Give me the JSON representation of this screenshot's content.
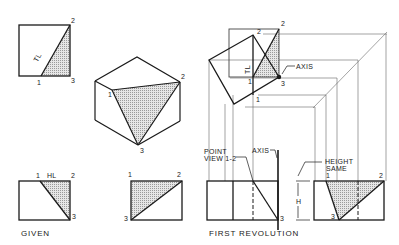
{
  "colors": {
    "line": "#1a1a1a",
    "thin": "#555555",
    "shade": "#d9d9d9"
  },
  "views": {
    "given": {
      "caption": "GIVEN",
      "top_view": {
        "labels": {
          "v1": "1",
          "v2": "2",
          "v3": "3",
          "tl": "TL"
        }
      },
      "front_view": {
        "labels": {
          "v1": "1",
          "v2": "2",
          "v3": "3",
          "hl": "HL"
        }
      }
    },
    "pictorial": {
      "labels": {
        "v1": "1",
        "v2": "2",
        "v3": "3"
      }
    },
    "auxiliary_front": {
      "labels": {
        "v1": "1",
        "v2": "2",
        "v3": "3"
      }
    },
    "first_revolution": {
      "caption": "FIRST REVOLUTION",
      "top_labels": {
        "v1": "1",
        "v2": "2",
        "v3": "3",
        "tl": "TL",
        "axis": "AXIS",
        "v1b": "1"
      },
      "front_labels": {
        "point_view_1": "POINT",
        "point_view_2": "VIEW 1-2",
        "axis": "AXIS",
        "v3": "3",
        "h": "H"
      },
      "side_labels": {
        "height_1": "HEIGHT",
        "height_2": "SAME",
        "v1": "1",
        "v2": "2",
        "v3": "3"
      }
    }
  }
}
